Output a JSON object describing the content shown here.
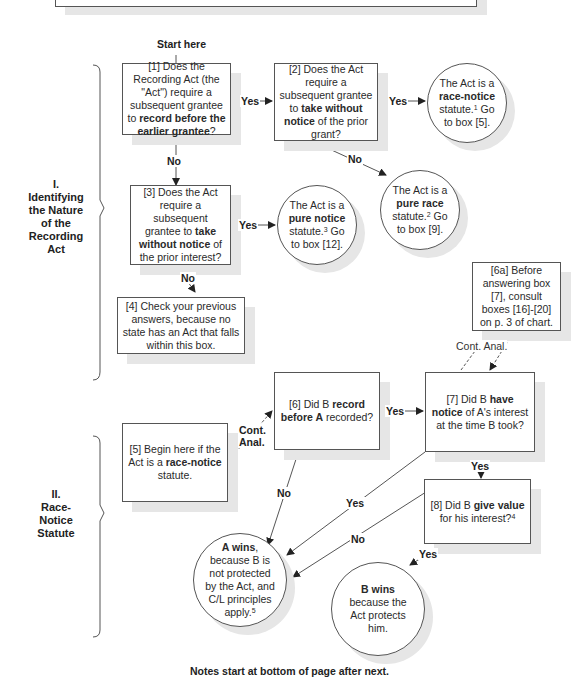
{
  "start_label": "Start here",
  "sections": [
    {
      "numeral": "I.",
      "title_lines": [
        "Identifying",
        "the Nature",
        "of the",
        "Recording",
        "Act"
      ]
    },
    {
      "numeral": "II.",
      "title_lines": [
        "Race-",
        "Notice",
        "Statute"
      ]
    }
  ],
  "boxes": {
    "b1": {
      "pre": "[1] Does the Recording Act (the \"Act\") require a subsequent grantee to ",
      "bold": "record before the earlier grantee",
      "post": "?"
    },
    "b2": {
      "pre": "[2] Does the Act require a subsequent grantee to ",
      "bold": "take without notice",
      "post": " of the prior grant?"
    },
    "b3": {
      "pre": "[3] Does the Act require a subsequent grantee to ",
      "bold": "take without notice",
      "post": " of the prior interest?"
    },
    "b4": {
      "text": "[4] Check your previous answers, because no state has an Act that falls within this box."
    },
    "b5": {
      "pre": "[5] Begin here if the Act is a ",
      "bold": "race-notice",
      "post": " statute."
    },
    "b6": {
      "pre": "[6] Did B ",
      "bold1": "record",
      "mid": " ",
      "bold2": "before A",
      "post": " recorded?"
    },
    "b6a": {
      "text": "[6a] Before answering box [7], consult boxes [16]-[20] on p. 3 of chart."
    },
    "b7": {
      "pre": "[7] Did B ",
      "bold": "have notice",
      "post": " of A's interest at the time B took?"
    },
    "b8": {
      "pre": "[8] Did B ",
      "bold": "give value",
      "post": " for his interest?",
      "note": "4"
    }
  },
  "circles": {
    "race_notice": {
      "pre": "The Act is a ",
      "bold": "race-notice",
      "post": " statute.",
      "note": "1",
      "tail": " Go to box [5]."
    },
    "pure_race": {
      "pre": "The Act is a ",
      "bold": "pure race",
      "post": " statute.",
      "note": "2",
      "tail": " Go to box [9]."
    },
    "pure_notice": {
      "pre": "The Act is a ",
      "bold": "pure notice",
      "post": " statute.",
      "note": "3",
      "tail": " Go to box [12]."
    },
    "a_wins": {
      "bold": "A wins",
      "post": ", because B is not protected by the Act, and C/L principles apply.",
      "note": "5"
    },
    "b_wins": {
      "bold": "B wins",
      "post": " because the Act protects him."
    }
  },
  "edge_labels": {
    "yes": "Yes",
    "no": "No",
    "cont_anal": "Cont. Anal.",
    "cont_line1": "Cont.",
    "cont_line2": "Anal."
  },
  "footer": "Notes start at bottom of page after next.",
  "colors": {
    "line": "#555555",
    "shadow": "#e6e6e6",
    "text": "#2a2a2a"
  }
}
